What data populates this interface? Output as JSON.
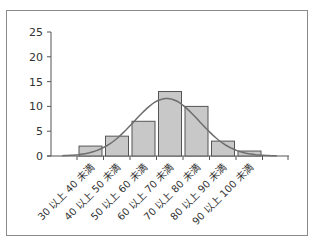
{
  "chart_data": {
    "type": "bar",
    "title": "",
    "xlabel": "",
    "ylabel": "",
    "ylim": [
      0,
      25
    ],
    "yticks": [
      0,
      5,
      10,
      15,
      20,
      25
    ],
    "grid": false,
    "legend": null,
    "categories": [
      "30 以上 40 未満",
      "40 以上 50 未満",
      "50 以上 60 未満",
      "60 以上 70 未満",
      "70 以上 80 未満",
      "80 以上 90 未満",
      "90 以上 100 未満"
    ],
    "values": [
      2,
      4,
      7,
      13,
      10,
      3,
      1
    ],
    "overlay": {
      "type": "line",
      "description": "normal distribution curve fitted over histogram",
      "peak_value": 11.6,
      "color": "#6e6e6e"
    },
    "bar_color": "#c8c8c8",
    "bar_edge_color": "#555555"
  }
}
